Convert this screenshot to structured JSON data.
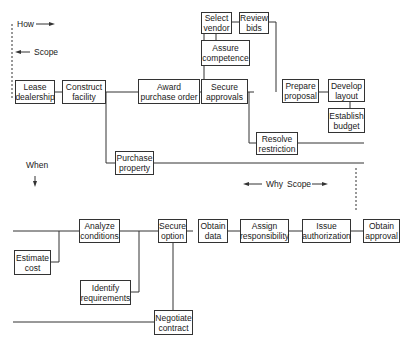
{
  "diagram": {
    "type": "FAST diagram",
    "axis_labels": {
      "how": "How",
      "scope_left": "Scope",
      "when": "When",
      "why": "Why",
      "scope_right": "Scope"
    },
    "top_section": {
      "nodes": [
        {
          "id": "lease",
          "label": "Lease dealership"
        },
        {
          "id": "construct",
          "label": "Construct facility"
        },
        {
          "id": "award",
          "label": "Award purchase order"
        },
        {
          "id": "select",
          "label": "Select vendor"
        },
        {
          "id": "review",
          "label": "Review bids"
        },
        {
          "id": "assure",
          "label": "Assure competence"
        },
        {
          "id": "secure_approvals",
          "label": "Secure approvals"
        },
        {
          "id": "prepare",
          "label": "Prepare proposal"
        },
        {
          "id": "develop",
          "label": "Develop layout"
        },
        {
          "id": "establish",
          "label": "Establish budget"
        },
        {
          "id": "resolve",
          "label": "Resolve restriction"
        },
        {
          "id": "purchase",
          "label": "Purchase property"
        }
      ]
    },
    "bottom_section": {
      "nodes": [
        {
          "id": "analyze",
          "label": "Analyze conditions"
        },
        {
          "id": "estimate",
          "label": "Estimate cost"
        },
        {
          "id": "secure_option",
          "label": "Secure option"
        },
        {
          "id": "identify",
          "label": "Identify requirements"
        },
        {
          "id": "obtain_data",
          "label": "Obtain data"
        },
        {
          "id": "assign",
          "label": "Assign responsibility"
        },
        {
          "id": "issue",
          "label": "Issue authorization"
        },
        {
          "id": "obtain_approval",
          "label": "Obtain approval"
        },
        {
          "id": "negotiate",
          "label": "Negotiate contract"
        }
      ]
    }
  }
}
